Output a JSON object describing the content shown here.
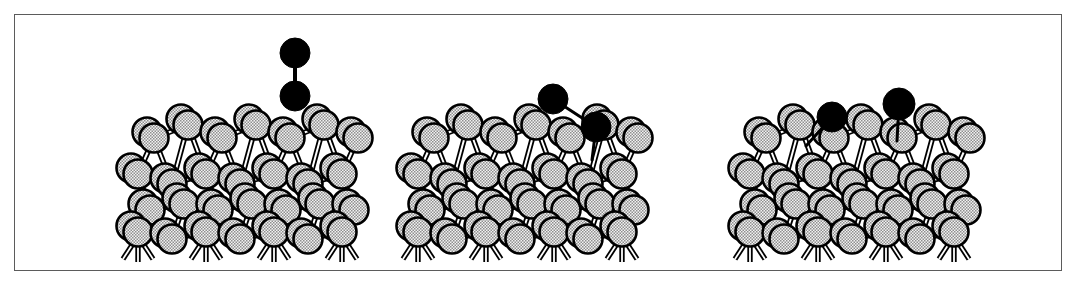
{
  "figure": {
    "title": "Dissociative adsorption of a diatomic molecule on a reconstructed surface",
    "caption": "",
    "background_color": "#ffffff",
    "frame": {
      "name": "figure-border",
      "x": 14,
      "y": 14,
      "width": 1048,
      "height": 257,
      "stroke_color": "#5b5b5b",
      "stroke_width": 1.5,
      "fill": "#ffffff"
    },
    "style": {
      "adsorbate_color": "#000000",
      "substrate_fill": "#e8e8e8",
      "substrate_stipple": "#9a9a9a",
      "substrate_outline": "#000000",
      "bond_color": "#000000",
      "atom_outline_width": 2.6,
      "substrate_atom_radius": 14.5,
      "adsorbate_atom_radius": 14.5
    }
  },
  "panels": [
    {
      "id": "panel-1",
      "name": "panel-physisorbed-molecule",
      "label": "",
      "stage": "gas-phase molecule above surface",
      "adsorbate": {
        "name": "diatomic-molecule",
        "orientation": "vertical",
        "atoms": [
          {
            "name": "adsorbate-atom-top",
            "cx": 295,
            "cy": 53,
            "r": 15,
            "color": "#000000"
          },
          {
            "name": "adsorbate-atom-bottom",
            "cx": 295,
            "cy": 96,
            "r": 15,
            "color": "#000000"
          }
        ],
        "bonds": [
          {
            "name": "intramolecular-bond",
            "x1": 295,
            "y1": 53,
            "x2": 295,
            "y2": 96,
            "width": 4
          }
        ]
      },
      "cluster": {
        "name": "substrate-cluster-1",
        "origin_x": 128,
        "origin_y": 128
      }
    },
    {
      "id": "panel-2",
      "name": "panel-chemisorbed-molecule",
      "label": "",
      "stage": "molecule bonded to surface, bond elongated and tilted",
      "adsorbate": {
        "name": "diatomic-molecule",
        "orientation": "tilted",
        "atoms": [
          {
            "name": "adsorbate-atom-free",
            "cx": 553,
            "cy": 99,
            "r": 15,
            "color": "#000000"
          },
          {
            "name": "adsorbate-atom-bonded",
            "cx": 596,
            "cy": 127,
            "r": 15,
            "color": "#000000"
          }
        ],
        "bonds": [
          {
            "name": "intramolecular-bond",
            "x1": 553,
            "y1": 99,
            "x2": 596,
            "y2": 127,
            "width": 3
          },
          {
            "name": "surface-bond",
            "x1": 596,
            "y1": 127,
            "x2": 592,
            "y2": 160,
            "width": 3
          }
        ]
      },
      "cluster": {
        "name": "substrate-cluster-2",
        "origin_x": 408,
        "origin_y": 128
      }
    },
    {
      "id": "panel-3",
      "name": "panel-dissociated-atoms",
      "label": "",
      "stage": "molecule dissociated, two atoms bonded separately to surface",
      "adsorbate": {
        "name": "dissociated-atoms",
        "orientation": "separated",
        "atoms": [
          {
            "name": "adsorbate-atom-left",
            "cx": 832,
            "cy": 117,
            "r": 15,
            "color": "#000000"
          },
          {
            "name": "adsorbate-atom-right",
            "cx": 899,
            "cy": 104,
            "r": 16,
            "color": "#000000"
          }
        ],
        "bonds": [
          {
            "name": "surface-bond-left",
            "x1": 832,
            "y1": 117,
            "x2": 806,
            "y2": 146,
            "width": 3
          },
          {
            "name": "surface-bond-right",
            "x1": 899,
            "y1": 104,
            "x2": 897,
            "y2": 141,
            "width": 3
          }
        ]
      },
      "cluster": {
        "name": "substrate-cluster-3",
        "origin_x": 740,
        "origin_y": 128
      }
    }
  ],
  "legend": {
    "present": false,
    "entries": [
      {
        "name": "adsorbate-atom",
        "label": "",
        "color": "#000000"
      },
      {
        "name": "substrate-atom",
        "label": "",
        "color": "#e8e8e8"
      }
    ]
  },
  "chart_data": {
    "type": "diagram",
    "xlabel": "",
    "ylabel": "",
    "panel_count": 3,
    "panel_stages": [
      "gas-phase molecule above surface",
      "chemisorbed tilted molecule",
      "dissociated adatoms"
    ],
    "adsorbate_atom_counts": [
      2,
      2,
      2
    ],
    "substrate_layers": 3,
    "annotations": []
  }
}
